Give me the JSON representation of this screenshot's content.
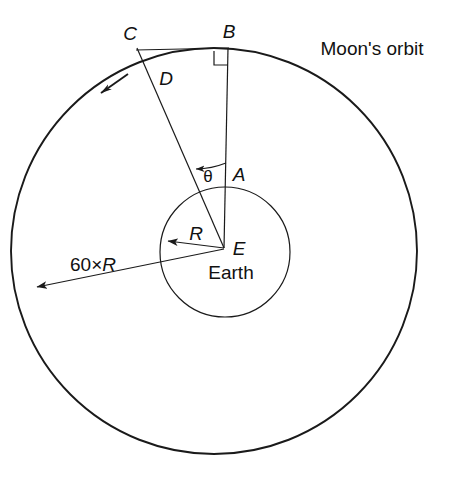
{
  "figure": {
    "background_color": "#ffffff",
    "line_color": "#1a1a1a",
    "labels": {
      "point_c": "C",
      "point_b": "B",
      "point_d": "D",
      "point_a": "A",
      "point_e": "E",
      "radius_r": "R",
      "angle_theta": "θ",
      "earth": "Earth",
      "orbit": "Moon's orbit",
      "orbit_radius_prefix": "60×",
      "orbit_radius_symbol": "R",
      "orbit_radius_full": "60×R"
    },
    "geometry": {
      "orbit_center_x": 214,
      "orbit_center_y": 251,
      "orbit_radius": 203,
      "earth_center_x": 225,
      "earth_center_y": 252,
      "earth_radius": 65,
      "point_b_x": 228,
      "point_b_y": 48,
      "point_c_x": 137,
      "point_c_y": 47,
      "point_d_x": 146,
      "point_d_y": 64,
      "point_a_x": 225,
      "point_a_y": 187,
      "point_e_x": 224,
      "point_e_y": 248
    }
  }
}
